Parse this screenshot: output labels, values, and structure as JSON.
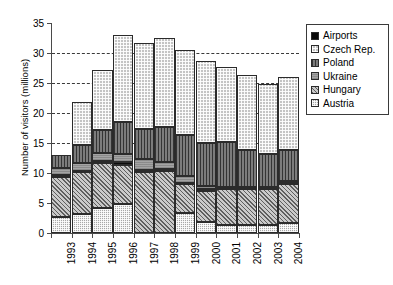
{
  "chart_data": {
    "type": "bar",
    "subtype": "stacked-bar",
    "title": "",
    "xlabel": "",
    "ylabel": "Number of visitors (millions)",
    "ylim": [
      0,
      35
    ],
    "yticks": [
      0,
      5,
      10,
      15,
      20,
      25,
      30,
      35
    ],
    "ytick_labels": [
      "0",
      "5",
      "10",
      "15",
      "20",
      "25",
      "30",
      "35"
    ],
    "grid": "horizontal-dashed",
    "grid_values": [
      15,
      20,
      25,
      30
    ],
    "legend_position": "right-outside",
    "categories": [
      "1993",
      "1994",
      "1995",
      "1996",
      "1997",
      "1998",
      "1999",
      "2000",
      "2001",
      "2002",
      "2003",
      "2004"
    ],
    "stack_order_bottom_to_top": [
      "Austria",
      "Hungary",
      "Airports",
      "Ukraine",
      "Poland",
      "Czech Rep."
    ],
    "series": [
      {
        "name": "Austria",
        "values": [
          2.7,
          3.1,
          4.2,
          4.9,
          0.0,
          0.0,
          3.4,
          1.9,
          1.3,
          1.4,
          1.3,
          1.7
        ]
      },
      {
        "name": "Hungary",
        "values": [
          6.7,
          7.0,
          7.5,
          6.5,
          10.2,
          10.4,
          4.7,
          5.1,
          6.1,
          5.9,
          6.0,
          6.4
        ]
      },
      {
        "name": "Airports",
        "values": [
          0.3,
          0.3,
          0.3,
          0.4,
          0.3,
          0.3,
          0.3,
          0.3,
          0.3,
          0.3,
          0.3,
          0.3
        ]
      },
      {
        "name": "Ukraine",
        "values": [
          1.1,
          1.2,
          1.3,
          1.4,
          1.8,
          1.1,
          1.1,
          0.6,
          0.0,
          0.0,
          0.0,
          0.3
        ]
      },
      {
        "name": "Poland",
        "values": [
          2.2,
          3.0,
          3.9,
          5.3,
          5.1,
          5.9,
          6.9,
          7.1,
          7.5,
          6.3,
          5.6,
          5.2
        ]
      },
      {
        "name": "Czech Rep.",
        "values": [
          0.0,
          7.2,
          10.0,
          14.5,
          14.2,
          14.8,
          14.1,
          13.7,
          12.4,
          12.4,
          11.6,
          12.1
        ]
      }
    ],
    "totals": [
      13.0,
      21.8,
      27.2,
      33.0,
      31.6,
      32.5,
      30.5,
      28.7,
      27.6,
      26.3,
      24.8,
      26.0
    ]
  },
  "legend": {
    "items": [
      {
        "label": "Airports",
        "swatch": "fill-airports"
      },
      {
        "label": "Czech Rep.",
        "swatch": "fill-czech"
      },
      {
        "label": "Poland",
        "swatch": "fill-poland"
      },
      {
        "label": "Ukraine",
        "swatch": "fill-ukraine"
      },
      {
        "label": "Hungary",
        "swatch": "fill-hungary"
      },
      {
        "label": "Austria",
        "swatch": "fill-austria"
      }
    ]
  }
}
